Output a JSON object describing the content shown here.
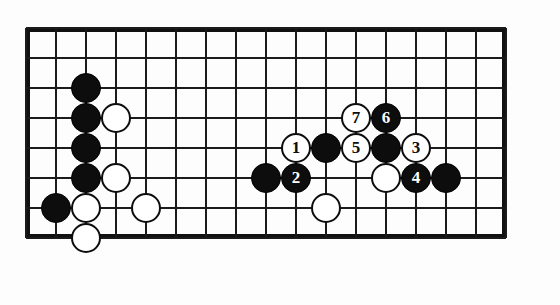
{
  "figure": {
    "kind": "go-board-diagram",
    "board": {
      "columns": 17,
      "rows": 8,
      "origin_x": 26,
      "origin_y": 28,
      "spacing": 30,
      "line_color": "#1b1b1b",
      "border_color": "#111111",
      "background_color": "#fdfdfd"
    },
    "colors": {
      "black_stone": "#0d0d0d",
      "white_stone": "#ffffff",
      "black_label_text": "#ffffff",
      "white_label_text": "#0d0d0d"
    }
  },
  "chart_data": {
    "type": "table",
    "title": "",
    "xlabel": "",
    "ylabel": "",
    "grid": true,
    "stones": [
      {
        "id": "b-c2-r2",
        "color": "black",
        "col": 2,
        "row": 2,
        "label": ""
      },
      {
        "id": "b-c2-r3",
        "color": "black",
        "col": 2,
        "row": 3,
        "label": ""
      },
      {
        "id": "w-c3-r3",
        "color": "white",
        "col": 3,
        "row": 3,
        "label": ""
      },
      {
        "id": "b-c2-r4",
        "color": "black",
        "col": 2,
        "row": 4,
        "label": ""
      },
      {
        "id": "b-c2-r5",
        "color": "black",
        "col": 2,
        "row": 5,
        "label": ""
      },
      {
        "id": "w-c3-r5",
        "color": "white",
        "col": 3,
        "row": 5,
        "label": ""
      },
      {
        "id": "b-c1-r6",
        "color": "black",
        "col": 1,
        "row": 6,
        "label": ""
      },
      {
        "id": "w-c2-r6",
        "color": "white",
        "col": 2,
        "row": 6,
        "label": ""
      },
      {
        "id": "w-c4-r6",
        "color": "white",
        "col": 4,
        "row": 6,
        "label": ""
      },
      {
        "id": "w-c2-r7",
        "color": "white",
        "col": 2,
        "row": 7,
        "label": ""
      },
      {
        "id": "w-m7-c11-r3",
        "color": "white",
        "col": 11,
        "row": 3,
        "label": "7"
      },
      {
        "id": "b-m6-c12-r3",
        "color": "black",
        "col": 12,
        "row": 3,
        "label": "6"
      },
      {
        "id": "w-m1-c9-r4",
        "color": "white",
        "col": 9,
        "row": 4,
        "label": "1"
      },
      {
        "id": "b-c10-r4",
        "color": "black",
        "col": 10,
        "row": 4,
        "label": ""
      },
      {
        "id": "w-m5-c11-r4",
        "color": "white",
        "col": 11,
        "row": 4,
        "label": "5"
      },
      {
        "id": "b-c12-r4",
        "color": "black",
        "col": 12,
        "row": 4,
        "label": ""
      },
      {
        "id": "w-m3-c13-r4",
        "color": "white",
        "col": 13,
        "row": 4,
        "label": "3"
      },
      {
        "id": "b-c8-r5",
        "color": "black",
        "col": 8,
        "row": 5,
        "label": ""
      },
      {
        "id": "b-m2-c9-r5",
        "color": "black",
        "col": 9,
        "row": 5,
        "label": "2"
      },
      {
        "id": "w-c12-r5",
        "color": "white",
        "col": 12,
        "row": 5,
        "label": ""
      },
      {
        "id": "b-m4-c13-r5",
        "color": "black",
        "col": 13,
        "row": 5,
        "label": "4"
      },
      {
        "id": "b-c14-r5",
        "color": "black",
        "col": 14,
        "row": 5,
        "label": ""
      },
      {
        "id": "w-c10-r6",
        "color": "white",
        "col": 10,
        "row": 6,
        "label": ""
      }
    ],
    "move_sequence": [
      {
        "move": 1,
        "color": "white",
        "col": 9,
        "row": 4
      },
      {
        "move": 2,
        "color": "black",
        "col": 9,
        "row": 5
      },
      {
        "move": 3,
        "color": "white",
        "col": 13,
        "row": 4
      },
      {
        "move": 4,
        "color": "black",
        "col": 13,
        "row": 5
      },
      {
        "move": 5,
        "color": "white",
        "col": 11,
        "row": 4
      },
      {
        "move": 6,
        "color": "black",
        "col": 12,
        "row": 3
      },
      {
        "move": 7,
        "color": "white",
        "col": 11,
        "row": 3
      }
    ]
  }
}
